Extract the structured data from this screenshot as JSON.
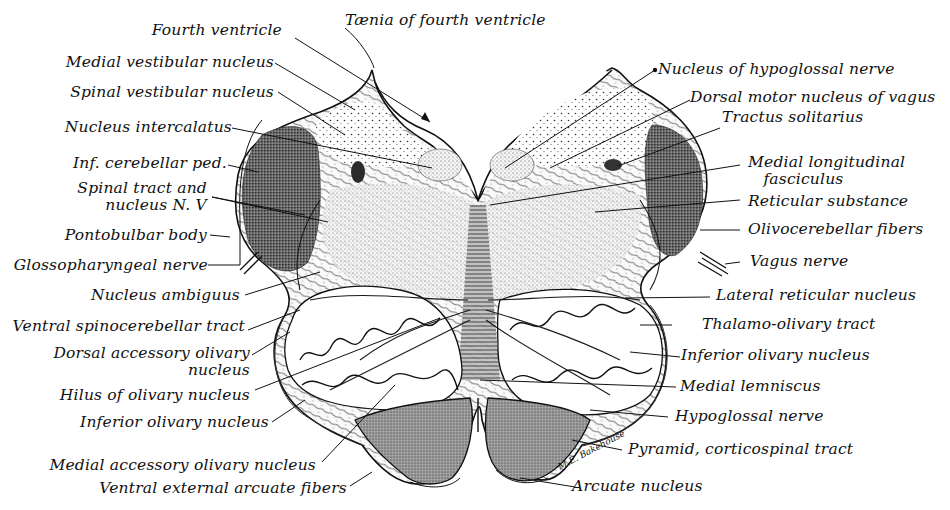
{
  "figure": {
    "signature": "M.E. Bakehouse",
    "colors": {
      "ink": "#111111",
      "background": "#ffffff",
      "shading_dark": "#3a3a3a",
      "shading_mid": "#8a8a8a",
      "shading_light": "#c9c9c9"
    }
  },
  "labels": {
    "left": [
      {
        "id": "fourth-ventricle",
        "text": "Fourth ventricle"
      },
      {
        "id": "medial-vestibular-nucleus",
        "text": "Medial vestibular nucleus"
      },
      {
        "id": "spinal-vestibular-nucleus",
        "text": "Spinal vestibular nucleus"
      },
      {
        "id": "nucleus-intercalatus",
        "text": "Nucleus intercalatus"
      },
      {
        "id": "inf-cerebellar-ped",
        "text": "Inf. cerebellar ped."
      },
      {
        "id": "spinal-tract-nucleus-v",
        "text": "Spinal tract and\n  nucleus N. V"
      },
      {
        "id": "pontobulbar-body",
        "text": "Pontobulbar body"
      },
      {
        "id": "glossopharyngeal-nerve",
        "text": "Glossopharyngeal nerve"
      },
      {
        "id": "nucleus-ambiguus",
        "text": "Nucleus ambiguus"
      },
      {
        "id": "ventral-spinocerebellar-tract",
        "text": "Ventral spinocerebellar tract"
      },
      {
        "id": "dorsal-accessory-olivary-nucleus",
        "text": "Dorsal accessory olivary\n                   nucleus"
      },
      {
        "id": "hilus-of-olivary-nucleus",
        "text": "Hilus of olivary nucleus"
      },
      {
        "id": "inferior-olivary-nucleus-left",
        "text": "Inferior olivary nucleus"
      },
      {
        "id": "medial-accessory-olivary-nucleus",
        "text": "Medial accessory olivary nucleus"
      },
      {
        "id": "ventral-external-arcuate-fibers",
        "text": "Ventral external arcuate fibers"
      }
    ],
    "top": [
      {
        "id": "taenia-of-fourth-ventricle",
        "text": "Tænia of fourth ventricle"
      }
    ],
    "right": [
      {
        "id": "nucleus-of-hypoglossal-nerve",
        "text": "Nucleus of hypoglossal nerve"
      },
      {
        "id": "dorsal-motor-nucleus-of-vagus",
        "text": "Dorsal motor nucleus of vagus"
      },
      {
        "id": "tractus-solitarius",
        "text": "Tractus solitarius"
      },
      {
        "id": "medial-longitudinal-fasciculus",
        "text": "Medial longitudinal\n   fasciculus"
      },
      {
        "id": "reticular-substance",
        "text": "Reticular substance"
      },
      {
        "id": "olivocerebellar-fibers",
        "text": "Olivocerebellar fibers"
      },
      {
        "id": "vagus-nerve",
        "text": "Vagus nerve"
      },
      {
        "id": "lateral-reticular-nucleus",
        "text": "Lateral reticular nucleus"
      },
      {
        "id": "thalamo-olivary-tract",
        "text": "Thalamo-olivary tract"
      },
      {
        "id": "inferior-olivary-nucleus-right",
        "text": "Inferior olivary nucleus"
      },
      {
        "id": "medial-lemniscus",
        "text": "Medial lemniscus"
      },
      {
        "id": "hypoglossal-nerve",
        "text": "Hypoglossal nerve"
      },
      {
        "id": "pyramid-corticospinal-tract",
        "text": "Pyramid, corticospinal tract"
      },
      {
        "id": "arcuate-nucleus",
        "text": "Arcuate nucleus"
      }
    ]
  }
}
